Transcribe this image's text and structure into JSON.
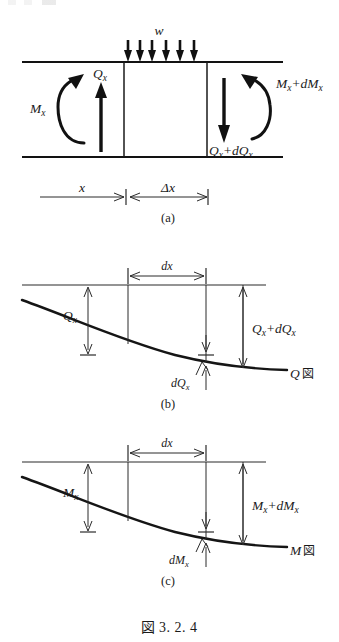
{
  "figure": {
    "caption_cjk": "図",
    "caption_number": "3. 2. 4",
    "panels": [
      {
        "id": "a",
        "panel_label": "(a)",
        "description": "beam-element-free-body",
        "labels": {
          "distributed_load": "w",
          "left_shear": "Q",
          "left_shear_sub": "x",
          "left_moment": "M",
          "left_moment_sub": "x",
          "right_moment": "M",
          "right_moment_sub": "x",
          "right_moment_plus": "+dM",
          "right_moment_plus_sub": "x",
          "right_shear": "Q",
          "right_shear_sub": "x",
          "right_shear_plus": "+dQ",
          "right_shear_plus_sub": "x"
        },
        "dimensions": {
          "left_dim": "x",
          "right_dim": "Δx"
        },
        "load_arrow_count": 6
      },
      {
        "id": "b",
        "panel_label": "(b)",
        "description": "shear-force-diagram",
        "labels": {
          "dim_dx": "dx",
          "ordinate_left": "Q",
          "ordinate_left_sub": "x",
          "ordinate_right": "Q",
          "ordinate_right_sub": "x",
          "ordinate_right_plus": "+dQ",
          "ordinate_right_plus_sub": "x",
          "increment": "dQ",
          "increment_sub": "x",
          "curve_name": "Q",
          "curve_name_cjk": "図"
        }
      },
      {
        "id": "c",
        "panel_label": "(c)",
        "description": "bending-moment-diagram",
        "labels": {
          "dim_dx": "dx",
          "ordinate_left": "M",
          "ordinate_left_sub": "x",
          "ordinate_right": "M",
          "ordinate_right_sub": "x",
          "ordinate_right_plus": "+dM",
          "ordinate_right_plus_sub": "x",
          "increment": "dM",
          "increment_sub": "x",
          "curve_name": "M",
          "curve_name_cjk": "図"
        }
      }
    ],
    "colors": {
      "ink": "#1a1a1a",
      "heavy_ink": "#111111",
      "background": "#ffffff"
    }
  }
}
